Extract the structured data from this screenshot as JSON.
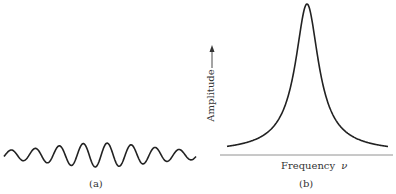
{
  "panels": {
    "a": {
      "caption": "(a)",
      "description": "wave packet: oscillation with amplitude envelope peaking at center",
      "cycles": 8
    },
    "b": {
      "caption": "(b)",
      "xlabel": "Frequency",
      "xlabel_symbol": "ν",
      "ylabel": "Amplitude",
      "ylabel_arrow": "→",
      "description": "sharply peaked resonance (Lorentzian-like) amplitude vs. frequency curve"
    }
  },
  "colors": {
    "stroke": "#222222",
    "axis": "#666666",
    "text": "#333333"
  }
}
